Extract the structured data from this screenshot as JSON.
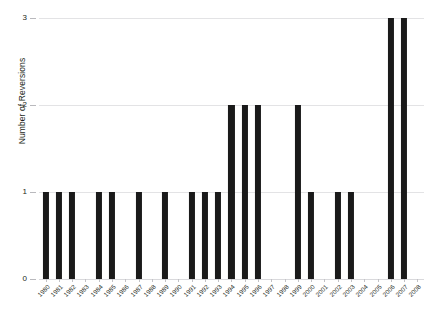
{
  "chart_data": {
    "type": "bar",
    "title": "",
    "subtitle": "",
    "xlabel": "",
    "ylabel": "Number of Reversions",
    "categories": [
      "1980",
      "1981",
      "1982",
      "1983",
      "1984",
      "1985",
      "1986",
      "1987",
      "1988",
      "1989",
      "1990",
      "1991",
      "1992",
      "1993",
      "1994",
      "1995",
      "1996",
      "1997",
      "1998",
      "1999",
      "2000",
      "2001",
      "2002",
      "2003",
      "2004",
      "2005",
      "2006",
      "2007",
      "2008"
    ],
    "values": [
      1,
      1,
      1,
      0,
      1,
      1,
      0,
      1,
      0,
      1,
      0,
      1,
      1,
      1,
      2,
      2,
      2,
      0,
      0,
      2,
      1,
      0,
      1,
      1,
      0,
      0,
      3,
      3,
      0
    ],
    "ylim": [
      0,
      3
    ],
    "yticks": [
      "0",
      "1",
      "2",
      "3"
    ],
    "ytick_values": [
      0,
      1,
      2,
      3
    ],
    "xlim_labels": [
      "1980",
      "2008"
    ],
    "grid": true,
    "grid_axis": "y",
    "legend": false,
    "legend_position": "none",
    "bar_color": "#1a1a1a",
    "grid_color": "#e3e3e5",
    "background_color": "#ffffff",
    "text_color": "#231f20"
  },
  "axes": {
    "y_title": "Number of Reversions"
  }
}
